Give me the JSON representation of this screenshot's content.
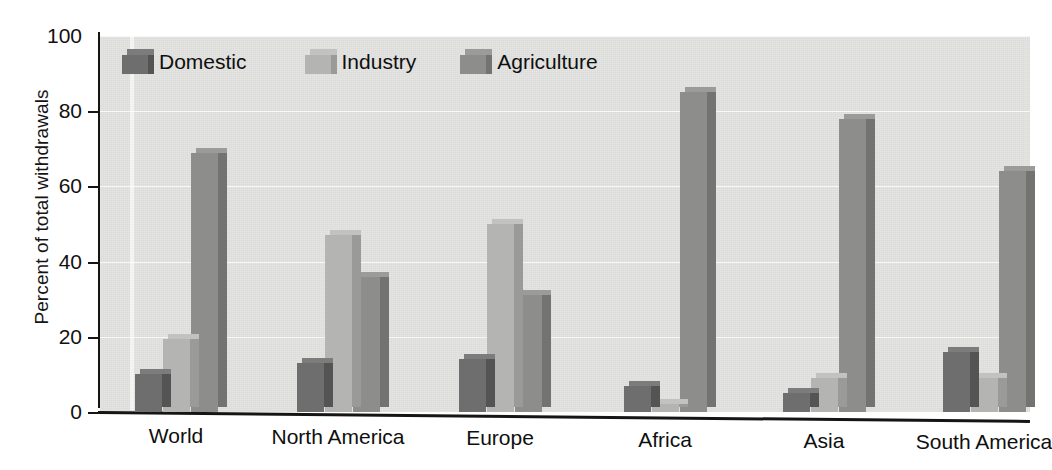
{
  "chart_data": {
    "type": "bar",
    "title": "",
    "xlabel": "",
    "ylabel": "Percent of total withdrawals",
    "ylim": [
      0,
      100
    ],
    "yticks": [
      0,
      20,
      40,
      60,
      80,
      100
    ],
    "ytick_labels": [
      "0",
      "20",
      "40",
      "60",
      "80",
      "100"
    ],
    "grid": "horizontal",
    "legend_position": "top-left-inside",
    "categories": [
      "World",
      "North America",
      "Europe",
      "Africa",
      "Asia",
      "South America"
    ],
    "series": [
      {
        "name": "Domestic",
        "color": "#6e6e6e",
        "values": [
          10,
          13,
          14,
          7,
          5,
          16
        ]
      },
      {
        "name": "Industry",
        "color": "#b4b4b2",
        "values": [
          19.5,
          47,
          50,
          2,
          9,
          9
        ]
      },
      {
        "name": "Agriculture",
        "color": "#8d8d8b",
        "values": [
          69,
          36,
          31,
          85,
          78,
          64
        ]
      }
    ]
  },
  "legend": {
    "items": [
      {
        "label": "Domestic"
      },
      {
        "label": "Industry"
      },
      {
        "label": "Agriculture"
      }
    ]
  },
  "colors": {
    "plot_background": "#e3e3e1",
    "page_background": "#ffffff",
    "axis": "#151515",
    "gridline": "#ffffff",
    "domestic": "#6e6e6e",
    "industry": "#b4b4b2",
    "agriculture": "#8d8d8b"
  }
}
